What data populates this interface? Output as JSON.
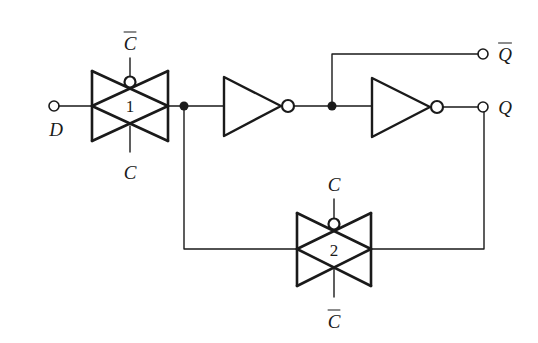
{
  "diagram": {
    "type": "circuit",
    "title": "",
    "colors": {
      "stroke": "#1a1a1a",
      "background": "#ffffff"
    },
    "labels": {
      "d_input": "D",
      "q_output": "Q",
      "q_bar_output": "Q",
      "gate1_number": "1",
      "gate1_top_control": "C",
      "gate1_bottom_control": "C",
      "gate2_number": "2",
      "gate2_top_control": "C",
      "gate2_bottom_control": "C"
    },
    "overlines": {
      "q_bar_output": true,
      "gate1_top_control": true,
      "gate1_bottom_control": false,
      "gate2_top_control": false,
      "gate2_bottom_control": true
    },
    "components": [
      {
        "id": "tg1",
        "kind": "transmission-gate",
        "number": "1",
        "bubble_control": "C-bar",
        "other_control": "C"
      },
      {
        "id": "inv1",
        "kind": "inverter"
      },
      {
        "id": "inv2",
        "kind": "inverter"
      },
      {
        "id": "tg2",
        "kind": "transmission-gate",
        "number": "2",
        "bubble_control": "C",
        "other_control": "C-bar"
      }
    ],
    "terminals": [
      "D",
      "Q",
      "Q-bar"
    ]
  }
}
